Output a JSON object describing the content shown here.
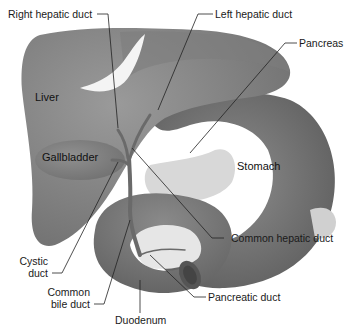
{
  "diagram": {
    "organ_labels": {
      "liver": "Liver",
      "gallbladder": "Gallbladder",
      "stomach": "Stomach"
    },
    "callouts": {
      "right_hepatic_duct": "Right hepatic duct",
      "left_hepatic_duct": "Left hepatic duct",
      "pancreas": "Pancreas",
      "common_hepatic_duct": "Common hepatic duct",
      "cystic_duct_line1": "Cystic",
      "cystic_duct_line2": "duct",
      "common_bile_duct_line1": "Common",
      "common_bile_duct_line2": "bile duct",
      "duodenum": "Duodenum",
      "pancreatic_duct": "Pancreatic duct"
    },
    "colors": {
      "background": "#ffffff",
      "liver": "#8a8a8a",
      "liver_dark": "#6f6f6f",
      "stomach": "#7c7c7c",
      "stomach_dark": "#5e5e5e",
      "pancreas": "#d6d6d6",
      "ligament": "#f2f2f2",
      "duct": "#6a6a6a",
      "leader_line": "#222222",
      "text": "#1a1a1a"
    }
  }
}
